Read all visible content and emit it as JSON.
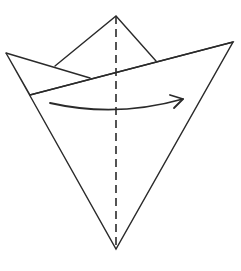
{
  "diagram": {
    "type": "origami-fold-step",
    "colors": {
      "line": "#2a2a2a",
      "background": "#ffffff"
    },
    "shapes": {
      "outline": "6,53 116,249 233,42",
      "top_peak": "55,66 116,16 156,61",
      "left_flap": "6,53 90,78",
      "front_layer_edge": "30,95 233,42",
      "center_valley_fold": {
        "x": 116,
        "y1": 16,
        "y2": 249
      },
      "fold_arrow": {
        "path": "M50,103 Q116,120 183,99",
        "head": "M170,94 L183,99 L172,108"
      }
    }
  }
}
